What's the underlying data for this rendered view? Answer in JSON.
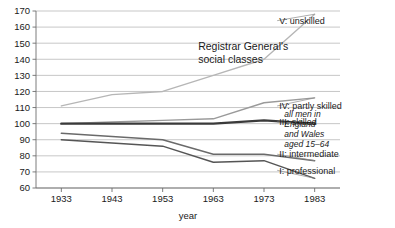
{
  "chart_data": {
    "type": "line",
    "title": "",
    "xlabel": "year",
    "ylabel": "",
    "categories": [
      "1933",
      "1943",
      "1953",
      "1963",
      "1973",
      "1983"
    ],
    "x": [
      1933,
      1943,
      1953,
      1963,
      1973,
      1983
    ],
    "xlim": [
      1928,
      1988
    ],
    "ylim": [
      60,
      170
    ],
    "yticks": [
      60,
      70,
      80,
      90,
      100,
      110,
      120,
      130,
      140,
      150,
      160,
      170
    ],
    "grid": "horizontal",
    "legend_position": "inline-right-of-line-ends",
    "series": [
      {
        "name": "V: unskilled",
        "label": "V: unskilled",
        "color": "#b6b6b6",
        "width": 1.4,
        "values": [
          111,
          118,
          120,
          130,
          140,
          168
        ],
        "label_x": 1976,
        "label_y": 164
      },
      {
        "name": "IV: partly skilled",
        "label": "IV: partly skilled",
        "color": "#9a9a9a",
        "width": 1.4,
        "values": [
          100,
          101,
          102,
          103,
          113,
          116
        ],
        "label_x": 1976,
        "label_y": 111
      },
      {
        "name": "III: skilled",
        "label": "III: skilled",
        "color": "#3a3a3a",
        "width": 2.4,
        "values": [
          100,
          100,
          100,
          100,
          102,
          100
        ],
        "label_x": 1976,
        "label_y": 101
      },
      {
        "name": "II: intermediate",
        "label": "II: intermediate",
        "color": "#6a6a6a",
        "width": 1.5,
        "values": [
          94,
          92,
          90,
          81,
          81,
          77
        ],
        "label_x": 1976,
        "label_y": 81
      },
      {
        "name": "I: professional",
        "label": "I: professional",
        "color": "#555555",
        "width": 1.5,
        "values": [
          90,
          88,
          86,
          76,
          77,
          66
        ],
        "label_x": 1976,
        "label_y": 71
      }
    ],
    "annotations": [
      {
        "name": "registrar-general-caption",
        "lines": [
          "Registrar General's",
          "social classes"
        ],
        "x": 1960,
        "y": 146,
        "style": "plain"
      },
      {
        "name": "population-note",
        "lines": [
          "all men in",
          "England",
          "and Wales",
          "aged 15–64"
        ],
        "x": 1977,
        "y": 104,
        "style": "italic"
      }
    ]
  },
  "axes": {
    "y_tick_labels": [
      "170",
      "160",
      "150",
      "140",
      "130",
      "120",
      "110",
      "100",
      "90",
      "80",
      "70",
      "60"
    ],
    "x_tick_labels": [
      "1933",
      "1943",
      "1953",
      "1963",
      "1973",
      "1983"
    ],
    "x_axis_title": "year"
  },
  "annotation_text": {
    "registrar_line1": "Registrar General's",
    "registrar_line2": "social classes",
    "note_line1": "all men in",
    "note_line2": "England",
    "note_line3": "and Wales",
    "note_line4": "aged 15–64"
  },
  "series_labels": {
    "v": "V: unskilled",
    "iv": "IV: partly skilled",
    "iii": "III: skilled",
    "ii": "II: intermediate",
    "i": "I: professional"
  }
}
